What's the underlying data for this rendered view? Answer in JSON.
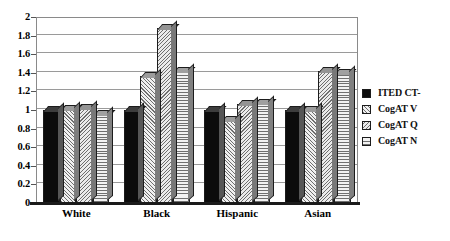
{
  "chart_data": {
    "type": "bar",
    "title": "",
    "subtitle": "",
    "xlabel": "",
    "ylabel": "",
    "categories": [
      "White",
      "Black",
      "Hispanic",
      "Asian"
    ],
    "series": [
      {
        "name": "ITED CT-",
        "values": [
          1.0,
          1.0,
          1.0,
          1.0
        ],
        "pattern": "solid-black"
      },
      {
        "name": "CogAT V",
        "values": [
          1.01,
          1.37,
          0.89,
          1.0
        ],
        "pattern": "diagonal-forward"
      },
      {
        "name": "CogAT Q",
        "values": [
          1.02,
          1.88,
          1.07,
          1.42
        ],
        "pattern": "diagonal-backward"
      },
      {
        "name": "CogAT N",
        "values": [
          0.96,
          1.42,
          1.08,
          1.4
        ],
        "pattern": "horizontal-lines"
      }
    ],
    "ylim": [
      0,
      2
    ],
    "ytick_step": 0.2,
    "ytick_labels": [
      "0",
      "0.2",
      "0.4",
      "0.6",
      "0.8",
      "1",
      "1.2",
      "1.4",
      "1.6",
      "1.8",
      "2"
    ],
    "ytick_values": [
      0,
      0.2,
      0.4,
      0.6,
      0.8,
      1,
      1.2,
      1.4,
      1.6,
      1.8,
      2
    ],
    "grid": true,
    "grid_axis": "y",
    "legend_position": "right",
    "style": "3d-bar",
    "colors": {
      "background": "#ffffff",
      "axis": "#1a1a1a",
      "gridline": "#9a9a9a",
      "bar_outline": "#1c1c1c",
      "series_1": "#0c0c0c",
      "series_2": "#f0f0f0",
      "series_3": "#ebebeb",
      "series_4": "#f2f2f2"
    }
  },
  "legend": {
    "items": [
      {
        "label": "ITED CT-"
      },
      {
        "label": "CogAT V"
      },
      {
        "label": "CogAT Q"
      },
      {
        "label": "CogAT N"
      }
    ]
  }
}
